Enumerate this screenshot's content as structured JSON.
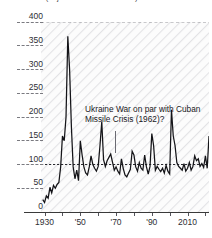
{
  "chart": {
    "title": "Risk index (adjusted U.S. stock basis)",
    "annotation": "Ukraine War on par with Cuban Missile Crisis (1962)?"
  },
  "chart_data": {
    "type": "line",
    "title": "Risk index (adjusted U.S. stock basis)",
    "subtitle": "",
    "xlabel": "",
    "ylabel": "",
    "xlim": [
      1928,
      2022
    ],
    "ylim": [
      0,
      400
    ],
    "grid": false,
    "legend": null,
    "reference_lines": [
      {
        "value": 100,
        "style": "dashed",
        "label": "100"
      },
      {
        "value": 400,
        "style": "dashed",
        "label": "400"
      }
    ],
    "yticks": [
      0,
      50,
      100,
      150,
      200,
      250,
      300,
      350,
      400
    ],
    "yticklabels": [
      "0",
      "50",
      "100",
      "150",
      "200",
      "250",
      "300",
      "350",
      "400"
    ],
    "xticks": [
      1930,
      1940,
      1950,
      1960,
      1970,
      1980,
      1990,
      2000,
      2010,
      2020
    ],
    "xticklabels": [
      "1930",
      "",
      "'50",
      "",
      "'70",
      "",
      "'90",
      "",
      "2010",
      ""
    ],
    "annotations": [
      {
        "text": "Ukraine War on par with Cuban Missile Crisis (1962)?",
        "x": 1962,
        "y": 100
      }
    ],
    "x": [
      1929,
      1930,
      1931,
      1932,
      1933,
      1934,
      1935,
      1936,
      1937,
      1938,
      1939,
      1940,
      1941,
      1942,
      1943,
      1944,
      1945,
      1946,
      1947,
      1948,
      1949,
      1950,
      1951,
      1952,
      1953,
      1954,
      1955,
      1956,
      1957,
      1958,
      1959,
      1960,
      1961,
      1962,
      1963,
      1964,
      1965,
      1966,
      1967,
      1968,
      1969,
      1970,
      1971,
      1972,
      1973,
      1974,
      1975,
      1976,
      1977,
      1978,
      1979,
      1980,
      1981,
      1982,
      1983,
      1984,
      1985,
      1986,
      1987,
      1988,
      1989,
      1990,
      1991,
      1992,
      1993,
      1994,
      1995,
      1996,
      1997,
      1998,
      1999,
      2000,
      2001,
      2002,
      2003,
      2004,
      2005,
      2006,
      2007,
      2008,
      2009,
      2010,
      2011,
      2012,
      2013,
      2014,
      2015,
      2016,
      2017,
      2018,
      2019,
      2020,
      2021,
      2022
    ],
    "y": [
      26,
      20,
      34,
      29,
      52,
      40,
      56,
      50,
      58,
      62,
      95,
      160,
      150,
      200,
      370,
      300,
      180,
      95,
      70,
      88,
      66,
      150,
      120,
      95,
      82,
      78,
      95,
      118,
      100,
      92,
      86,
      96,
      140,
      190,
      110,
      96,
      108,
      115,
      122,
      105,
      88,
      95,
      86,
      80,
      112,
      92,
      78,
      74,
      82,
      90,
      128,
      120,
      95,
      86,
      104,
      92,
      88,
      120,
      95,
      80,
      96,
      165,
      140,
      88,
      96,
      90,
      85,
      92,
      82,
      98,
      86,
      80,
      215,
      160,
      140,
      104,
      96,
      92,
      88,
      102,
      86,
      92,
      104,
      88,
      96,
      118,
      108,
      112,
      96,
      102,
      94,
      118,
      92,
      160
    ],
    "series": [
      {
        "name": "Geopolitical risk index",
        "color": "#141418",
        "values": [
          26,
          20,
          34,
          29,
          52,
          40,
          56,
          50,
          58,
          62,
          95,
          160,
          150,
          200,
          370,
          300,
          180,
          95,
          70,
          88,
          66,
          150,
          120,
          95,
          82,
          78,
          95,
          118,
          100,
          92,
          86,
          96,
          140,
          190,
          110,
          96,
          108,
          115,
          122,
          105,
          88,
          95,
          86,
          80,
          112,
          92,
          78,
          74,
          82,
          90,
          128,
          120,
          95,
          86,
          104,
          92,
          88,
          120,
          95,
          80,
          96,
          165,
          140,
          88,
          96,
          90,
          85,
          92,
          82,
          98,
          86,
          80,
          215,
          160,
          140,
          104,
          96,
          92,
          88,
          102,
          86,
          92,
          104,
          88,
          96,
          118,
          108,
          112,
          96,
          102,
          94,
          118,
          92,
          160
        ]
      }
    ]
  }
}
